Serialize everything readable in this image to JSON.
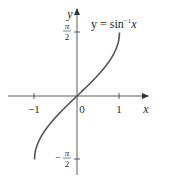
{
  "chart_data": {
    "type": "line",
    "title": "",
    "function_label": "y = sin⁻¹x",
    "function_label_parts": {
      "prefix": "y = sin",
      "superscript": "−1",
      "suffix": "x"
    },
    "xlabel": "x",
    "ylabel": "y",
    "x_ticks": [
      {
        "value": -1,
        "label": "−1"
      },
      {
        "value": 0,
        "label": "0"
      },
      {
        "value": 1,
        "label": "1"
      }
    ],
    "y_ticks": [
      {
        "value": 1.5708,
        "label_num": "π",
        "label_den": "2",
        "sign": ""
      },
      {
        "value": -1.5708,
        "label_num": "π",
        "label_den": "2",
        "sign": "−"
      }
    ],
    "xlim": [
      -1.8,
      1.7
    ],
    "ylim": [
      -2.1,
      2.1
    ],
    "grid": false,
    "series": [
      {
        "name": "arcsin",
        "x": [
          -1,
          -0.9,
          -0.75,
          -0.5,
          -0.25,
          0,
          0.25,
          0.5,
          0.75,
          0.9,
          1
        ],
        "y": [
          -1.5708,
          -1.1198,
          -0.8481,
          -0.5236,
          -0.2527,
          0,
          0.2527,
          0.5236,
          0.8481,
          1.1198,
          1.5708
        ]
      }
    ]
  },
  "colors": {
    "axis": "#333333",
    "curve": "#555555",
    "text": "#2a2a2a"
  }
}
